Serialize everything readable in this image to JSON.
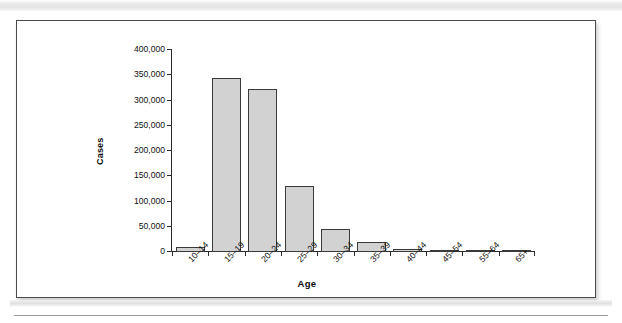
{
  "figure": {
    "kind": "bar-chart-figure"
  },
  "chart_data": {
    "type": "bar",
    "title": "",
    "xlabel": "Age",
    "ylabel": "Cases",
    "categories": [
      "10–14",
      "15–19",
      "20–24",
      "25–29",
      "30–34",
      "35–39",
      "40–44",
      "45–54",
      "55–64",
      "65+"
    ],
    "values": [
      9000,
      345000,
      323000,
      130000,
      46000,
      19000,
      6000,
      2500,
      300,
      100
    ],
    "ylim": [
      0,
      400000
    ],
    "yticks": [
      0,
      50000,
      100000,
      150000,
      200000,
      250000,
      300000,
      350000,
      400000
    ],
    "ytick_labels": [
      "0",
      "50,000",
      "100,000",
      "150,000",
      "200,000",
      "250,000",
      "300,000",
      "350,000",
      "400,000"
    ],
    "grid": false,
    "legend": null,
    "bar_fill_color": "#d2d2d2",
    "bar_edge_color": "#3a3a3a",
    "axis_color": "#2a2a2a",
    "text_color": "#111111"
  }
}
